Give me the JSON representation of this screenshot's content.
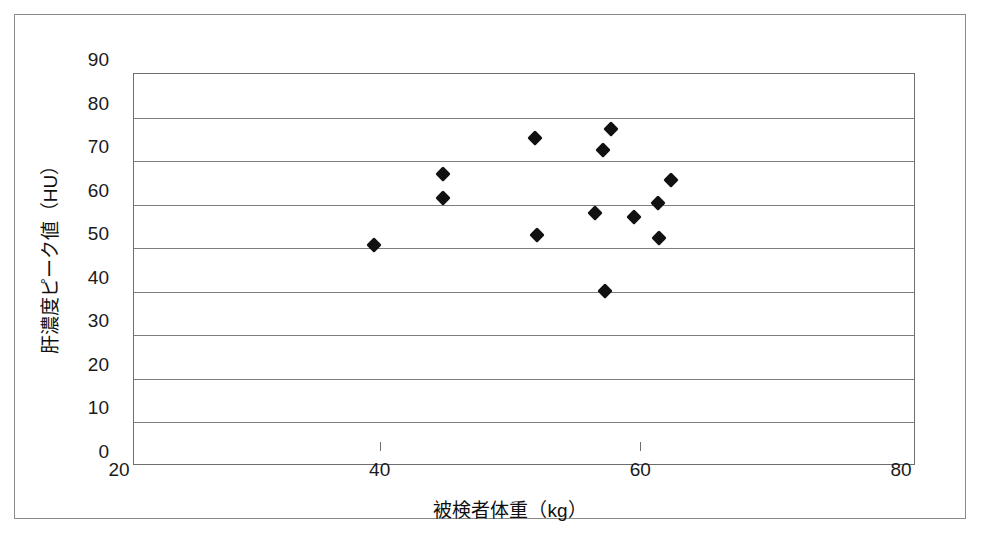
{
  "figure": {
    "background_color": "#ffffff",
    "frame_color": "#8a8a8a",
    "axis_color": "#6e6e6e",
    "marker_color": "#111111"
  },
  "chart_data": {
    "type": "scatter",
    "title": "",
    "xlabel": "被検者体重（kg）",
    "ylabel": "肝濃度ピーク値（HU）",
    "xlim": [
      20,
      80
    ],
    "ylim": [
      0,
      90
    ],
    "xticks": [
      20,
      40,
      60,
      80
    ],
    "yticks": [
      0,
      10,
      20,
      30,
      40,
      50,
      60,
      70,
      80,
      90
    ],
    "xtick_labels": [
      "20",
      "40",
      "60",
      "80"
    ],
    "ytick_labels": [
      "0",
      "10",
      "20",
      "30",
      "40",
      "50",
      "60",
      "70",
      "80",
      "90"
    ],
    "grid": "horizontal",
    "legend": null,
    "marker_shape": "diamond",
    "points": [
      {
        "x": 38.4,
        "y": 50.8
      },
      {
        "x": 43.7,
        "y": 67.0
      },
      {
        "x": 43.7,
        "y": 61.6
      },
      {
        "x": 50.8,
        "y": 75.2
      },
      {
        "x": 50.9,
        "y": 53.0
      },
      {
        "x": 55.4,
        "y": 58.2
      },
      {
        "x": 56.0,
        "y": 72.5
      },
      {
        "x": 56.1,
        "y": 40.2
      },
      {
        "x": 56.6,
        "y": 77.4
      },
      {
        "x": 58.4,
        "y": 57.2
      },
      {
        "x": 60.2,
        "y": 60.4
      },
      {
        "x": 60.3,
        "y": 52.3
      },
      {
        "x": 61.2,
        "y": 65.6
      }
    ]
  }
}
